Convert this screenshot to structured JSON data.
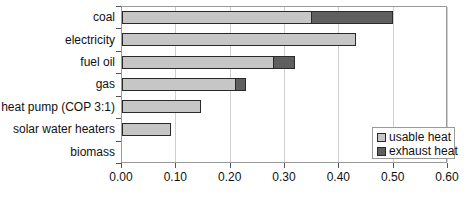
{
  "chart_data": {
    "type": "bar",
    "orientation": "horizontal",
    "stacked": true,
    "title": "",
    "xlabel": "",
    "ylabel": "",
    "categories": [
      "coal",
      "electricity",
      "fuel oil",
      "gas",
      "heat pump (COP 3:1)",
      "solar water heaters",
      "biomass"
    ],
    "series": [
      {
        "name": "usable heat",
        "color": "#c6c6c6",
        "values": [
          0.35,
          0.43,
          0.28,
          0.21,
          0.145,
          0.09,
          0
        ]
      },
      {
        "name": "exhaust heat",
        "color": "#5f5f5f",
        "values": [
          0.15,
          0,
          0.04,
          0.02,
          0,
          0,
          0
        ]
      }
    ],
    "xlim": [
      0,
      0.6
    ],
    "x_ticks": [
      "0.00",
      "0.10",
      "0.20",
      "0.30",
      "0.40",
      "0.50",
      "0.60"
    ],
    "grid": "vertical",
    "legend_position": "inside-bottom-right"
  }
}
